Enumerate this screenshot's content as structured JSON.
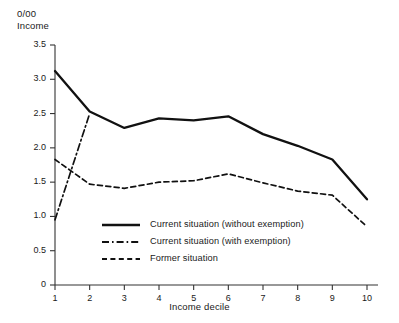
{
  "chart_data": {
    "type": "line",
    "title": "",
    "ylabel": "0/00\nIncome",
    "ylabel_line1": "0/00",
    "ylabel_line2": "Income",
    "xlabel": "Income decile",
    "categories": [
      "1",
      "2",
      "3",
      "4",
      "5",
      "6",
      "7",
      "8",
      "9",
      "10"
    ],
    "x": [
      1,
      2,
      3,
      4,
      5,
      6,
      7,
      8,
      9,
      10
    ],
    "ylim": [
      0,
      3.5
    ],
    "xlim": [
      1,
      10
    ],
    "yticks": [
      "0",
      "0.5",
      "1.0",
      "1.5",
      "2.0",
      "2.5",
      "3.0",
      "3.5"
    ],
    "ytick_values": [
      0,
      0.5,
      1.0,
      1.5,
      2.0,
      2.5,
      3.0,
      3.5
    ],
    "grid": false,
    "legend_position": "inside-lower-center",
    "series": [
      {
        "name": "Current situation (without exemption)",
        "style": "solid",
        "color": "#111111",
        "values": [
          3.12,
          2.53,
          2.29,
          2.43,
          2.4,
          2.46,
          2.2,
          2.03,
          1.83,
          1.25
        ]
      },
      {
        "name": "Current situation (with exemption)",
        "style": "dash-dot",
        "color": "#111111",
        "values": [
          0.95,
          2.5,
          null,
          null,
          null,
          null,
          null,
          null,
          null,
          null
        ]
      },
      {
        "name": "Former situation",
        "style": "dashed",
        "color": "#111111",
        "values": [
          1.83,
          1.47,
          1.41,
          1.5,
          1.52,
          1.62,
          1.49,
          1.37,
          1.31,
          0.85
        ]
      }
    ]
  }
}
